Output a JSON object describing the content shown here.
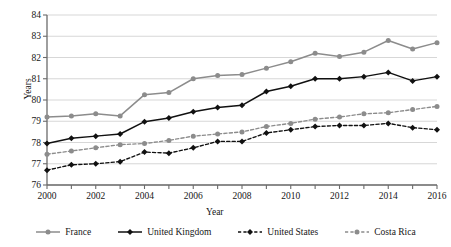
{
  "chart_data": {
    "type": "line",
    "title": "",
    "xlabel": "Year",
    "ylabel": "Years",
    "xlim": [
      2000,
      2016
    ],
    "ylim": [
      76,
      84
    ],
    "y_ticks": [
      76,
      77,
      78,
      79,
      80,
      81,
      82,
      83,
      84
    ],
    "x_ticks": [
      2000,
      2001,
      2002,
      2003,
      2004,
      2005,
      2006,
      2007,
      2008,
      2009,
      2010,
      2011,
      2012,
      2013,
      2014,
      2015,
      2016
    ],
    "x_tick_labels": [
      2000,
      2002,
      2004,
      2006,
      2008,
      2010,
      2012,
      2014,
      2016
    ],
    "grid": "horizontal",
    "legend_position": "bottom",
    "x": [
      2000,
      2001,
      2002,
      2003,
      2004,
      2005,
      2006,
      2007,
      2008,
      2009,
      2010,
      2011,
      2012,
      2013,
      2014,
      2015,
      2016
    ],
    "series": [
      {
        "name": "France",
        "color": "#8c8c8c",
        "line_style": "solid",
        "marker": "circle",
        "values": [
          79.2,
          79.25,
          79.35,
          79.25,
          80.25,
          80.35,
          81.0,
          81.15,
          81.2,
          81.5,
          81.8,
          82.2,
          82.05,
          82.25,
          82.8,
          82.4,
          82.7
        ]
      },
      {
        "name": "United Kingdom",
        "color": "#111111",
        "line_style": "solid",
        "marker": "diamond",
        "values": [
          77.95,
          78.2,
          78.3,
          78.4,
          78.98,
          79.15,
          79.45,
          79.65,
          79.75,
          80.4,
          80.65,
          81.0,
          81.0,
          81.1,
          81.3,
          80.9,
          81.1
        ]
      },
      {
        "name": "United States",
        "color": "#111111",
        "line_style": "dashed",
        "marker": "diamond",
        "values": [
          76.7,
          76.95,
          77.0,
          77.1,
          77.55,
          77.5,
          77.75,
          78.05,
          78.05,
          78.45,
          78.6,
          78.75,
          78.8,
          78.8,
          78.9,
          78.7,
          78.6
        ]
      },
      {
        "name": "Costa Rica",
        "color": "#8c8c8c",
        "line_style": "dashed",
        "marker": "circle",
        "values": [
          77.45,
          77.6,
          77.75,
          77.9,
          77.95,
          78.1,
          78.3,
          78.4,
          78.5,
          78.75,
          78.9,
          79.1,
          79.2,
          79.35,
          79.4,
          79.55,
          79.7
        ]
      }
    ]
  },
  "axes": {
    "y_title": "Years",
    "x_title": "Year",
    "y_tick_labels": [
      "84",
      "83",
      "82",
      "81",
      "80",
      "79",
      "78",
      "77",
      "76"
    ],
    "x_tick_labels": [
      "2000",
      "2002",
      "2004",
      "2006",
      "2008",
      "2010",
      "2012",
      "2014",
      "2016"
    ]
  },
  "legend": {
    "items": [
      {
        "label": "France"
      },
      {
        "label": "United Kingdom"
      },
      {
        "label": "United States"
      },
      {
        "label": "Costa Rica"
      }
    ]
  }
}
